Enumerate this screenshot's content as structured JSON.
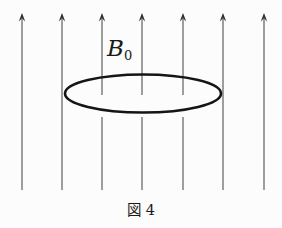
{
  "figure": {
    "caption": "図 4",
    "field_label": {
      "base": "B",
      "subscript": "0"
    }
  },
  "diagram": {
    "colors": {
      "background": "#fcfcfc",
      "line": "#4f4f4f",
      "arrowhead": "#2a2a2a",
      "loop": "#151515",
      "text": "#1a1a1a"
    },
    "field_lines": {
      "direction": "up",
      "x_positions": [
        22,
        62,
        102,
        142,
        183,
        223,
        264
      ],
      "tip_y": 13,
      "bottom_y": 190,
      "interrupted_indices": [
        2,
        3,
        4
      ],
      "gap_top": 95,
      "gap_bottom": 117,
      "shaft_width": 1.1
    },
    "loop_ellipse": {
      "cx": 143,
      "cy": 93.5,
      "rx": 78,
      "ry": 19,
      "stroke_width": 2.6
    },
    "label_position": {
      "x": 107,
      "y": 56,
      "sub_dy": 3.5
    },
    "caption_position": {
      "x": 141,
      "y": 215
    }
  }
}
